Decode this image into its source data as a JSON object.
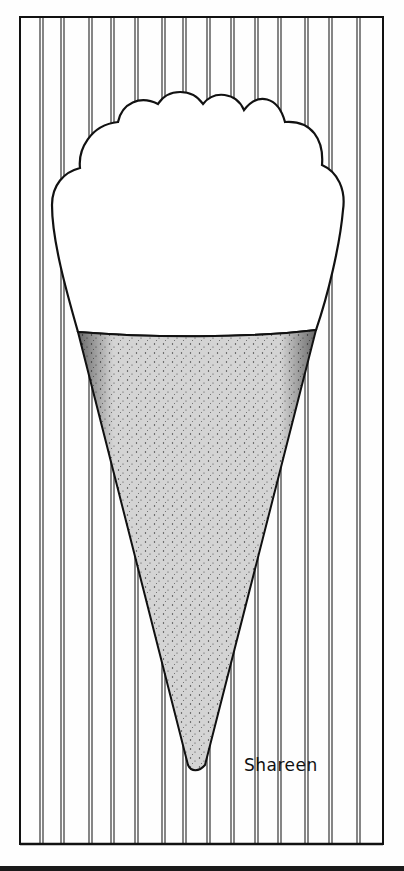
{
  "artwork": {
    "subject": "ice cream cone",
    "signature": "Shareen",
    "colors": {
      "ink": "#111111",
      "paper": "#fefefe",
      "cone_fill": "#cfcfcf",
      "stipple": "#2a2a2a"
    },
    "frame": {
      "x": 20,
      "y": 17,
      "width": 363,
      "height": 827
    },
    "stripe_pairs_x": [
      40,
      61,
      89,
      111,
      135,
      162,
      183,
      207,
      231,
      255,
      278,
      305,
      329,
      357
    ]
  }
}
